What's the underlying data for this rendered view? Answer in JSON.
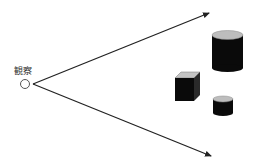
{
  "diagram": {
    "observer": {
      "label": "観察",
      "position": [
        25,
        84
      ]
    },
    "arrows": [
      {
        "name": "upper-view-ray",
        "from": [
          33,
          84
        ],
        "to": [
          210,
          13
        ]
      },
      {
        "name": "lower-view-ray",
        "from": [
          33,
          84
        ],
        "to": [
          212,
          157
        ]
      }
    ],
    "objects": [
      {
        "type": "cylinder",
        "size": "large",
        "x": 212,
        "y": 30,
        "w": 31,
        "h": 42
      },
      {
        "type": "cube",
        "x": 175,
        "y": 72,
        "w": 25,
        "h": 29
      },
      {
        "type": "cylinder",
        "size": "small",
        "x": 213,
        "y": 96,
        "w": 20,
        "h": 20
      }
    ],
    "colors": {
      "line": "#222222",
      "object_body": "#0a0a0a",
      "object_top": "#bdbdbd",
      "observer_fill": "#ffffff",
      "observer_stroke": "#555555"
    }
  }
}
